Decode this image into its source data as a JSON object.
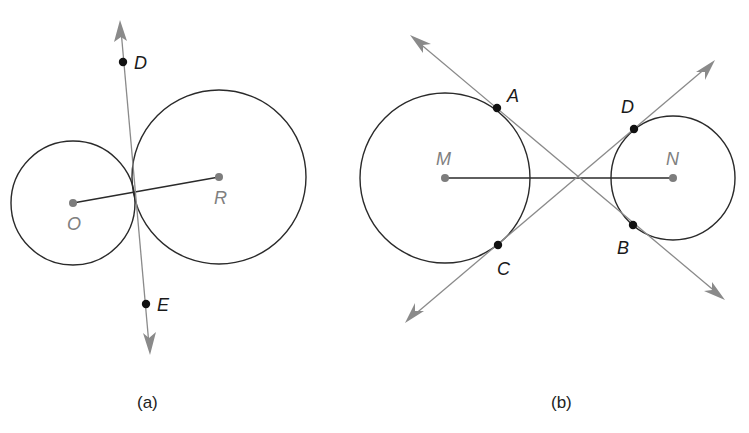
{
  "figures": [
    {
      "caption": "(a)",
      "description": "Two externally tangent circles O and R with common internal tangent line DE",
      "circles": [
        {
          "name": "O",
          "label": "O"
        },
        {
          "name": "R",
          "label": "R"
        }
      ],
      "points": [
        {
          "name": "D",
          "label": "D"
        },
        {
          "name": "E",
          "label": "E"
        }
      ],
      "segments": [
        "OR"
      ],
      "lines": [
        "DE"
      ]
    },
    {
      "caption": "(b)",
      "description": "Two circles M and N with common internal tangents AB and CD intersecting on segment MN",
      "circles": [
        {
          "name": "M",
          "label": "M"
        },
        {
          "name": "N",
          "label": "N"
        }
      ],
      "points": [
        {
          "name": "A",
          "label": "A"
        },
        {
          "name": "B",
          "label": "B"
        },
        {
          "name": "C",
          "label": "C"
        },
        {
          "name": "D",
          "label": "D"
        }
      ],
      "segments": [
        "MN"
      ],
      "lines": [
        "AB",
        "CD"
      ]
    }
  ],
  "colors": {
    "circle_stroke": "#2a2a2a",
    "tangent_line": "#8a8a8a",
    "point": "#111111",
    "center_point": "#7d7d7d",
    "center_label": "#808080"
  }
}
